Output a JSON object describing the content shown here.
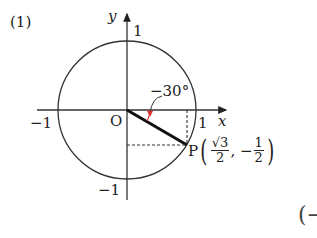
{
  "problem_number": "(1)",
  "axes": {
    "x_label": "x",
    "y_label": "y"
  },
  "ticks": {
    "x_pos": "1",
    "x_neg": "−1",
    "y_pos": "1",
    "y_neg": "−1"
  },
  "origin_label": "O",
  "angle_label": "−30°",
  "point": {
    "name": "P",
    "x_num": "√3",
    "x_den": "2",
    "y_sign": "−",
    "y_num": "1",
    "y_den": "2"
  },
  "partial_text": "(−",
  "colors": {
    "ink": "#222222",
    "angle_arrow": "#e03030"
  }
}
